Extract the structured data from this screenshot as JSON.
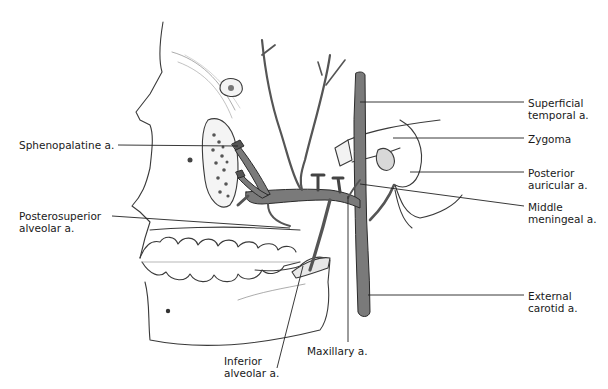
{
  "figure": {
    "colors": {
      "artery_fill": "#7a7a7a",
      "artery_edge": "#2a2a2a",
      "bone_line": "#3a3a3a",
      "leader_line": "#222222",
      "label_text": "#1a1a1a",
      "background": "#ffffff"
    }
  },
  "labels": {
    "sphenopalatine": {
      "line1": "Sphenopalatine a."
    },
    "posterosuperior_alveolar": {
      "line1": "Posterosuperior",
      "line2": "alveolar a."
    },
    "inferior_alveolar": {
      "line1": "Inferior",
      "line2": "alveolar a."
    },
    "maxillary": {
      "line1": "Maxillary a."
    },
    "superficial_temporal": {
      "line1": "Superficial",
      "line2": "temporal a."
    },
    "zygoma": {
      "line1": "Zygoma"
    },
    "posterior_auricular": {
      "line1": "Posterior",
      "line2": "auricular a."
    },
    "middle_meningeal": {
      "line1": "Middle",
      "line2": "meningeal a."
    },
    "external_carotid": {
      "line1": "External",
      "line2": "carotid a."
    }
  }
}
